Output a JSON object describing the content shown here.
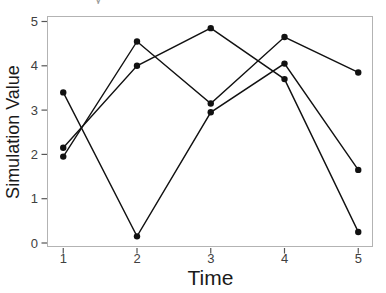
{
  "decorations": {
    "cropped_glyph": "y"
  },
  "colors": {
    "line": "#111111",
    "marker": "#111111",
    "tick_mark": "#555555",
    "tick_label": "#404040",
    "axis_title": "#1a1a1a",
    "panel_border": "#b3b3b3",
    "background": "#ffffff"
  },
  "chart_data": {
    "type": "line",
    "title": "",
    "xlabel": "Time",
    "ylabel": "Simulation Value",
    "x": [
      1,
      2,
      3,
      4,
      5
    ],
    "xticks": [
      "1",
      "2",
      "3",
      "4",
      "5"
    ],
    "yticks": [
      "0",
      "1",
      "2",
      "3",
      "4",
      "5"
    ],
    "xlim": [
      0.78,
      5.35
    ],
    "ylim": [
      -0.12,
      5.12
    ],
    "grid": false,
    "legend": false,
    "marker": "filled-circle",
    "series": [
      {
        "name": "series-1",
        "values": [
          3.4,
          0.15,
          2.95,
          4.05,
          1.65
        ]
      },
      {
        "name": "series-2",
        "values": [
          1.95,
          4.55,
          3.15,
          4.65,
          3.85
        ]
      },
      {
        "name": "series-3",
        "values": [
          2.15,
          4.0,
          4.85,
          3.7,
          0.25
        ]
      }
    ]
  }
}
